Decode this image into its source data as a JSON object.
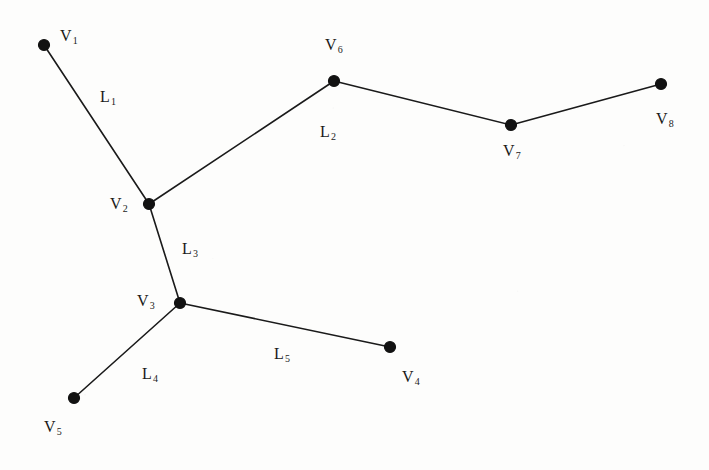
{
  "figure": {
    "background_color": "#fdfdfc",
    "stroke_color": "#1a1a1a",
    "width": 709,
    "height": 470
  },
  "chart_data": {
    "type": "diagram",
    "subtype": "node-link-graph",
    "title": "",
    "nodes": [
      {
        "id": "V1",
        "label": "V",
        "sub": "1",
        "x": 44,
        "y": 45,
        "label_x": 60,
        "label_y": 28
      },
      {
        "id": "V2",
        "label": "V",
        "sub": "2",
        "x": 149,
        "y": 204,
        "label_x": 110,
        "label_y": 196
      },
      {
        "id": "V3",
        "label": "V",
        "sub": "3",
        "x": 180,
        "y": 303,
        "label_x": 137,
        "label_y": 293
      },
      {
        "id": "V4",
        "label": "V",
        "sub": "4",
        "x": 390,
        "y": 347,
        "label_x": 402,
        "label_y": 369
      },
      {
        "id": "V5",
        "label": "V",
        "sub": "5",
        "x": 74,
        "y": 398,
        "label_x": 44,
        "label_y": 419
      },
      {
        "id": "V6",
        "label": "V",
        "sub": "6",
        "x": 334,
        "y": 81,
        "label_x": 325,
        "label_y": 37
      },
      {
        "id": "V7",
        "label": "V",
        "sub": "7",
        "x": 511,
        "y": 125,
        "label_x": 503,
        "label_y": 143
      },
      {
        "id": "V8",
        "label": "V",
        "sub": "8",
        "x": 661,
        "y": 84,
        "label_x": 656,
        "label_y": 111
      }
    ],
    "edges": [
      {
        "id": "L1",
        "label": "L",
        "sub": "1",
        "from": "V1",
        "to": "V2",
        "points": "44,45 149,204",
        "label_x": 100,
        "label_y": 89
      },
      {
        "id": "L2",
        "label": "L",
        "sub": "2",
        "from": "V2",
        "to": "V8",
        "points": "149,204 334,81 511,125 661,84",
        "label_x": 320,
        "label_y": 124
      },
      {
        "id": "L3",
        "label": "L",
        "sub": "3",
        "from": "V2",
        "to": "V3",
        "points": "149,204 180,303",
        "label_x": 182,
        "label_y": 241
      },
      {
        "id": "L4",
        "label": "L",
        "sub": "4",
        "from": "V3",
        "to": "V5",
        "points": "180,303 74,398",
        "label_x": 142,
        "label_y": 366
      },
      {
        "id": "L5",
        "label": "L",
        "sub": "5",
        "from": "V3",
        "to": "V4",
        "points": "180,303 390,347",
        "label_x": 274,
        "label_y": 346
      }
    ],
    "node_radius": 5.5,
    "legend": "none",
    "grid": false,
    "xlabel": "",
    "ylabel": ""
  }
}
